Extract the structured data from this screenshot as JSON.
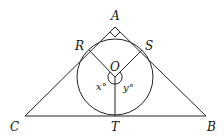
{
  "diagram": {
    "type": "geometry",
    "points": {
      "A": {
        "label": "A",
        "x": 115,
        "y": 27
      },
      "B": {
        "label": "B",
        "x": 206,
        "y": 116
      },
      "C": {
        "label": "C",
        "x": 25,
        "y": 116
      },
      "O": {
        "label": "O",
        "x": 115,
        "y": 77
      },
      "R": {
        "label": "R",
        "x": 89,
        "y": 50
      },
      "S": {
        "label": "S",
        "x": 142,
        "y": 50
      },
      "T": {
        "label": "T",
        "x": 115,
        "y": 116
      }
    },
    "circle": {
      "center": "O",
      "radius": 38
    },
    "angles": {
      "x": {
        "label": "x°",
        "between": [
          "OR",
          "OT"
        ]
      },
      "y": {
        "label": "y°",
        "between": [
          "OS",
          "OT"
        ]
      },
      "right_angle_at": "A"
    },
    "labels": {
      "A": "A",
      "B": "B",
      "C": "C",
      "O": "O",
      "R": "R",
      "S": "S",
      "T": "T",
      "x": "x°",
      "y": "y°"
    },
    "colors": {
      "stroke": "#222222",
      "background": "#ffffff"
    }
  }
}
